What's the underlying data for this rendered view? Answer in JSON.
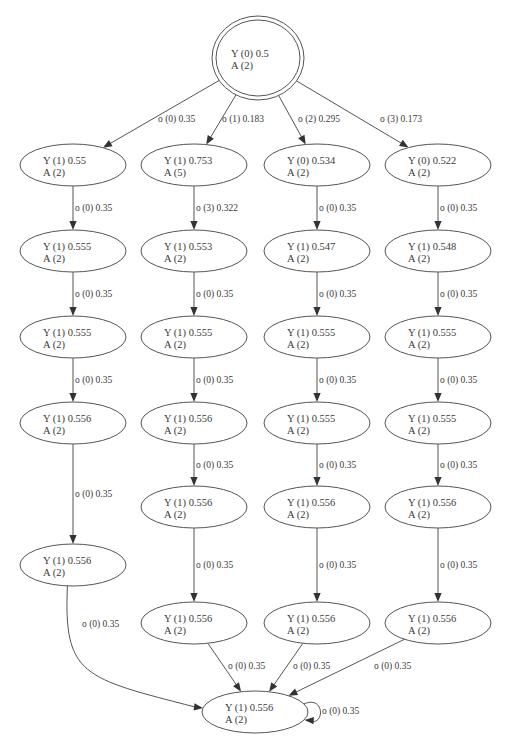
{
  "diagram": {
    "type": "state-transition-graph",
    "nodes": [
      {
        "id": "root",
        "line1": "Y (0) 0.5",
        "line2": "A (2)",
        "x": 258,
        "y": 58,
        "rx": 46,
        "ry": 42,
        "double": true
      },
      {
        "id": "c1r1",
        "line1": "Y (1) 0.55",
        "line2": "A (2)",
        "x": 73,
        "y": 165,
        "rx": 53,
        "ry": 21
      },
      {
        "id": "c1r2",
        "line1": "Y (1) 0.555",
        "line2": "A (2)",
        "x": 73,
        "y": 251,
        "rx": 53,
        "ry": 21
      },
      {
        "id": "c1r3",
        "line1": "Y (1) 0.555",
        "line2": "A (2)",
        "x": 73,
        "y": 337,
        "rx": 53,
        "ry": 21
      },
      {
        "id": "c1r4",
        "line1": "Y (1) 0.556",
        "line2": "A (2)",
        "x": 73,
        "y": 423,
        "rx": 53,
        "ry": 21
      },
      {
        "id": "c1r5",
        "line1": "Y (1) 0.556",
        "line2": "A (2)",
        "x": 73,
        "y": 565,
        "rx": 53,
        "ry": 21
      },
      {
        "id": "c2r1",
        "line1": "Y (1) 0.753",
        "line2": "A (5)",
        "x": 194,
        "y": 165,
        "rx": 53,
        "ry": 21
      },
      {
        "id": "c2r2",
        "line1": "Y (1) 0.553",
        "line2": "A (2)",
        "x": 194,
        "y": 251,
        "rx": 53,
        "ry": 21
      },
      {
        "id": "c2r3",
        "line1": "Y (1) 0.555",
        "line2": "A (2)",
        "x": 194,
        "y": 337,
        "rx": 53,
        "ry": 21
      },
      {
        "id": "c2r4",
        "line1": "Y (1) 0.556",
        "line2": "A (2)",
        "x": 194,
        "y": 423,
        "rx": 53,
        "ry": 21
      },
      {
        "id": "c2r5",
        "line1": "Y (1) 0.556",
        "line2": "A (2)",
        "x": 194,
        "y": 507,
        "rx": 53,
        "ry": 21
      },
      {
        "id": "c2r6",
        "line1": "Y (1) 0.556",
        "line2": "A (2)",
        "x": 194,
        "y": 623,
        "rx": 53,
        "ry": 21
      },
      {
        "id": "c3r1",
        "line1": "Y (0) 0.534",
        "line2": "A (2)",
        "x": 317,
        "y": 165,
        "rx": 53,
        "ry": 21
      },
      {
        "id": "c3r2",
        "line1": "Y (1) 0.547",
        "line2": "A (2)",
        "x": 317,
        "y": 251,
        "rx": 53,
        "ry": 21
      },
      {
        "id": "c3r3",
        "line1": "Y (1) 0.555",
        "line2": "A (2)",
        "x": 317,
        "y": 337,
        "rx": 53,
        "ry": 21
      },
      {
        "id": "c3r4",
        "line1": "Y (1) 0.555",
        "line2": "A (2)",
        "x": 317,
        "y": 423,
        "rx": 53,
        "ry": 21
      },
      {
        "id": "c3r5",
        "line1": "Y (1) 0.556",
        "line2": "A (2)",
        "x": 317,
        "y": 507,
        "rx": 53,
        "ry": 21
      },
      {
        "id": "c3r6",
        "line1": "Y (1) 0.556",
        "line2": "A (2)",
        "x": 317,
        "y": 623,
        "rx": 53,
        "ry": 21
      },
      {
        "id": "c4r1",
        "line1": "Y (0) 0.522",
        "line2": "A (2)",
        "x": 438,
        "y": 165,
        "rx": 53,
        "ry": 21
      },
      {
        "id": "c4r2",
        "line1": "Y (1) 0.548",
        "line2": "A (2)",
        "x": 438,
        "y": 251,
        "rx": 53,
        "ry": 21
      },
      {
        "id": "c4r3",
        "line1": "Y (1) 0.555",
        "line2": "A (2)",
        "x": 438,
        "y": 337,
        "rx": 53,
        "ry": 21
      },
      {
        "id": "c4r4",
        "line1": "Y (1) 0.555",
        "line2": "A (2)",
        "x": 438,
        "y": 423,
        "rx": 53,
        "ry": 21
      },
      {
        "id": "c4r5",
        "line1": "Y (1) 0.556",
        "line2": "A (2)",
        "x": 438,
        "y": 507,
        "rx": 53,
        "ry": 21
      },
      {
        "id": "c4r6",
        "line1": "Y (1) 0.556",
        "line2": "A (2)",
        "x": 438,
        "y": 623,
        "rx": 53,
        "ry": 21
      },
      {
        "id": "sink",
        "line1": "Y (1) 0.556",
        "line2": "A (2)",
        "x": 255,
        "y": 712,
        "rx": 53,
        "ry": 21
      }
    ],
    "edges": [
      {
        "from": "root",
        "to": "c1r1",
        "label": "o (0) 0.35",
        "lx": 158,
        "ly": 122
      },
      {
        "from": "root",
        "to": "c2r1",
        "label": "o (1) 0.183",
        "lx": 222,
        "ly": 122
      },
      {
        "from": "root",
        "to": "c3r1",
        "label": "o (2) 0.295",
        "lx": 298,
        "ly": 122
      },
      {
        "from": "root",
        "to": "c4r1",
        "label": "o (3) 0.173",
        "lx": 380,
        "ly": 122
      },
      {
        "from": "c1r1",
        "to": "c1r2",
        "label": "o (0) 0.35"
      },
      {
        "from": "c1r2",
        "to": "c1r3",
        "label": "o (0) 0.35"
      },
      {
        "from": "c1r3",
        "to": "c1r4",
        "label": "o (0) 0.35"
      },
      {
        "from": "c1r4",
        "to": "c1r5",
        "label": "o (0) 0.35"
      },
      {
        "from": "c1r5",
        "to": "sink",
        "label": "o (0) 0.35",
        "curve": true,
        "lx": 82,
        "ly": 627
      },
      {
        "from": "c2r1",
        "to": "c2r2",
        "label": "o (3) 0.322"
      },
      {
        "from": "c2r2",
        "to": "c2r3",
        "label": "o (0) 0.35"
      },
      {
        "from": "c2r3",
        "to": "c2r4",
        "label": "o (0) 0.35"
      },
      {
        "from": "c2r4",
        "to": "c2r5",
        "label": "o (0) 0.35"
      },
      {
        "from": "c2r5",
        "to": "c2r6",
        "label": "o (0) 0.35"
      },
      {
        "from": "c2r6",
        "to": "sink",
        "label": "o (0) 0.35",
        "lx": 228,
        "ly": 669
      },
      {
        "from": "c3r1",
        "to": "c3r2",
        "label": "o (0) 0.35"
      },
      {
        "from": "c3r2",
        "to": "c3r3",
        "label": "o (0) 0.35"
      },
      {
        "from": "c3r3",
        "to": "c3r4",
        "label": "o (0) 0.35"
      },
      {
        "from": "c3r4",
        "to": "c3r5",
        "label": "o (0) 0.35"
      },
      {
        "from": "c3r5",
        "to": "c3r6",
        "label": "o (0) 0.35"
      },
      {
        "from": "c3r6",
        "to": "sink",
        "label": "o (0) 0.35",
        "lx": 293,
        "ly": 669
      },
      {
        "from": "c4r1",
        "to": "c4r2",
        "label": "o (0) 0.35"
      },
      {
        "from": "c4r2",
        "to": "c4r3",
        "label": "o (0) 0.35"
      },
      {
        "from": "c4r3",
        "to": "c4r4",
        "label": "o (0) 0.35"
      },
      {
        "from": "c4r4",
        "to": "c4r5",
        "label": "o (0) 0.35"
      },
      {
        "from": "c4r5",
        "to": "c4r6",
        "label": "o (0) 0.35"
      },
      {
        "from": "c4r6",
        "to": "sink",
        "label": "o (0) 0.35",
        "lx": 374,
        "ly": 669
      },
      {
        "from": "sink",
        "to": "sink",
        "label": "o (0) 0.35",
        "self": true,
        "lx": 322,
        "ly": 714
      }
    ]
  }
}
